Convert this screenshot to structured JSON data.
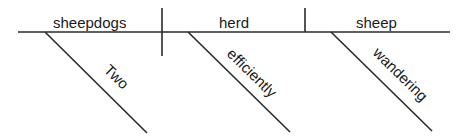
{
  "diagram": {
    "type": "Reed-Kellogg sentence diagram",
    "sentence_parts": {
      "subject": "sheepdogs",
      "verb": "herd",
      "direct_object": "sheep"
    },
    "modifiers": {
      "subject_modifier": "Two",
      "verb_modifier": "efficiently",
      "object_modifier": "wandering"
    }
  }
}
